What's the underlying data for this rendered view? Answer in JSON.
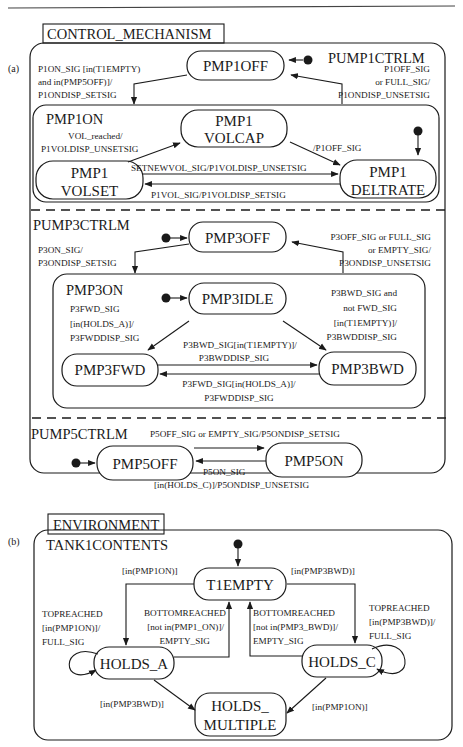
{
  "figure": {
    "top_rule": true,
    "panel_a": {
      "tag": "(a)",
      "title": "CONTROL_MECHANISM",
      "regions": {
        "pump1": {
          "name": "PUMP1CTRLM",
          "states": {
            "off": "PMP1OFF",
            "on": "PMP1ON",
            "volcap_1": "PMP1",
            "volcap_2": "VOLCAP",
            "volset_1": "PMP1",
            "volset_2": "VOLSET",
            "deltrate_1": "PMP1",
            "deltrate_2": "DELTRATE"
          },
          "transitions": {
            "off_to_on": [
              "P1ON_SIG [in(T1EMPTY)",
              "and in(PMP5OFF)]/",
              "P1ONDISP_SETSIG"
            ],
            "on_to_off": [
              "P1OFF_SIG",
              "or FULL_SIG/",
              "P1ONDISP_UNSETSIG"
            ],
            "volset_to_volcap": [
              "VOL_reached/",
              "P1VOLDISP_UNSETSIG"
            ],
            "volcap_to_deltrate": "/P1OFF_SIG",
            "volset_to_deltrate": "SETNEWVOL_SIG/P1VOLDISP_UNSETSIG",
            "deltrate_to_volset": "P1VOL_SIG/P1VOLDISP_SETSIG"
          }
        },
        "pump3": {
          "name": "PUMP3CTRLM",
          "states": {
            "off": "PMP3OFF",
            "on": "PMP3ON",
            "idle": "PMP3IDLE",
            "fwd": "PMP3FWD",
            "bwd": "PMP3BWD"
          },
          "transitions": {
            "off_to_on": [
              "P3ON_SIG/",
              "P3ONDISP_SETSIG"
            ],
            "on_to_off": [
              "P3OFF_SIG or FULL_SIG",
              "or EMPTY_SIG/",
              "P3ONDISP_UNSETSIG"
            ],
            "idle_to_fwd": [
              "P3FWD_SIG",
              "[in(HOLDS_A)]/",
              "P3FWDDISP_SIG"
            ],
            "idle_to_bwd": [
              "P3BWD_SIG and",
              "not FWD_SIG",
              "[in(T1EMPTY)]/",
              "P3BWDDISP_SIG"
            ],
            "fwd_to_bwd": [
              "P3BWD_SIG[in(T1EMPTY)]/",
              "P3BWDDISP_SIG"
            ],
            "bwd_to_fwd": [
              "P3FWD_SIG[in(HOLDS_A)]/",
              "P3FWDDISP_SIG"
            ]
          }
        },
        "pump5": {
          "name": "PUMP5CTRLM",
          "states": {
            "off": "PMP5OFF",
            "on": "PMP5ON"
          },
          "transitions": {
            "on_to_off_top": "P5OFF_SIG or EMPTY_SIG/P5ONDISP_SETSIG",
            "off_to_on": "P5ON_SIG",
            "on_to_off_bottom": "[in(HOLDS_C)]/P5ONDISP_UNSETSIG"
          }
        }
      }
    },
    "panel_b": {
      "tag": "(b)",
      "title": "ENVIRONMENT",
      "region": {
        "name": "TANK1CONTENTS",
        "states": {
          "empty": "T1EMPTY",
          "holds_a": "HOLDS_A",
          "holds_c": "HOLDS_C",
          "multiple_1": "HOLDS_",
          "multiple_2": "MULTIPLE"
        },
        "transitions": {
          "empty_to_a": "[in(PMP1ON)]",
          "empty_to_c": "[in(PMP3BWD)]",
          "a_self": [
            "TOPREACHED",
            "[in(PMP1ON)]/",
            "FULL_SIG"
          ],
          "a_to_empty": [
            "BOTTOMREACHED",
            "[not in(PMP1_ON)]/",
            "EMPTY_SIG"
          ],
          "c_to_empty": [
            "BOTTOMREACHED",
            "[not in(PMP3_BWD)]/",
            "EMPTY_SIG"
          ],
          "c_self": [
            "TOPREACHED",
            "[in(PMP3BWD)]/",
            "FULL_SIG"
          ],
          "a_to_multiple": "[in(PMP3BWD)]",
          "c_to_multiple": "[in(PMP1ON)]"
        }
      }
    }
  }
}
